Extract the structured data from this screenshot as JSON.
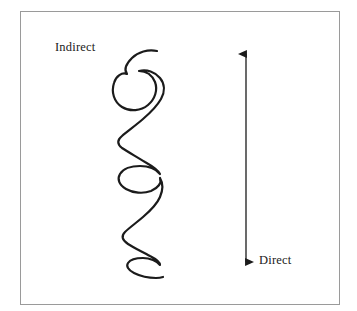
{
  "figure": {
    "width": 357,
    "height": 311,
    "background_color": "#ffffff",
    "frame": {
      "border_color": "#9a9a9a",
      "fill_color": "#ffffff",
      "x": 20,
      "y": 11,
      "width": 320,
      "height": 294
    }
  },
  "labels": {
    "indirect": "Indirect",
    "direct": "Direct"
  },
  "arrow": {
    "color": "#1b1b1b",
    "x": 246,
    "y_top": 48,
    "y_bottom": 268,
    "double_headed": true
  },
  "squiggle": {
    "color": "#1b1b1b",
    "stroke_width": 2.2,
    "start": [
      157,
      51
    ],
    "end": [
      163,
      277
    ],
    "loops": 2,
    "path": "M157,51 C148,49 138,52 132,58 C126,64 124,70 127,74 C122,72 116,76 114,83 C111,92 114,102 122,107 C130,112 141,111 148,105 C155,99 158,90 155,82 C152,75 146,71 139,71 C147,69 155,72 160,78 C165,84 165,92 161,99 C157,106 150,113 143,119 C136,125 128,131 122,136 C117,140 117,144 122,148 C128,152 137,157 145,162 C152,166 158,170 160,174 C156,169 148,166 140,166 C131,166 123,169 120,174 C117,179 119,185 126,189 C133,193 143,194 151,191 C158,188 162,183 160,178 C163,183 163,190 160,197 C157,204 150,211 143,217 C136,223 129,228 125,232 C121,236 122,240 128,244 C134,248 143,252 150,256 C156,259 160,262 160,265 C157,261 150,258 143,258 C136,258 130,260 128,263 C126,266 128,270 134,273 C140,276 149,278 156,278 C160,278 163,277 163,277"
  }
}
